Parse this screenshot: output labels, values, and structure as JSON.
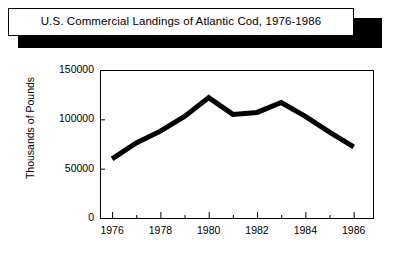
{
  "title": {
    "text": "U.S. Commercial Landings of Atlantic Cod, 1976-1986"
  },
  "chart_data": {
    "type": "line",
    "title": "U.S. Commercial Landings of Atlantic Cod, 1976-1986",
    "xlabel": "",
    "ylabel": "Thousands of Pounds",
    "x": [
      1976,
      1977,
      1978,
      1979,
      1980,
      1981,
      1982,
      1983,
      1984,
      1985,
      1986
    ],
    "values": [
      60000,
      76000,
      88000,
      103000,
      122000,
      105000,
      107000,
      117000,
      103000,
      87000,
      72000
    ],
    "xlim": [
      1975.5,
      1986.8
    ],
    "ylim": [
      0,
      150000
    ],
    "ytick_labels": [
      "0",
      "50000",
      "100000",
      "150000"
    ],
    "ytick_values": [
      0,
      50000,
      100000,
      150000
    ],
    "xtick_labels": [
      "1976",
      "1978",
      "1980",
      "1982",
      "1984",
      "1986"
    ],
    "xtick_values": [
      1976,
      1978,
      1980,
      1982,
      1984,
      1986
    ],
    "xminor_values": [
      1977,
      1979,
      1981,
      1983,
      1985
    ],
    "grid": false,
    "legend": false,
    "line_color": "#000000",
    "line_width": 5,
    "background": "#ffffff"
  }
}
